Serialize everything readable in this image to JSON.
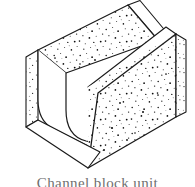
{
  "figure": {
    "title": "Channel block unit",
    "caption": "Channel block unit",
    "drawing_style": "isometric line drawing",
    "background_color": "#ffffff",
    "line_color": "#1a1a1a",
    "fill_color": "#ffffff",
    "speckle_color": "#111111",
    "caption_color": "#6f6f6f",
    "caption_clipped": true,
    "parts": [
      {
        "name": "far-wall",
        "label": "Far wall"
      },
      {
        "name": "near-wall",
        "label": "Near wall"
      },
      {
        "name": "channel-cavity",
        "label": "U-shaped channel cavity"
      },
      {
        "name": "left-end-face",
        "label": "Left end face"
      },
      {
        "name": "right-end-face",
        "label": "Right end face"
      },
      {
        "name": "base-slab",
        "label": "Base slab"
      }
    ]
  }
}
